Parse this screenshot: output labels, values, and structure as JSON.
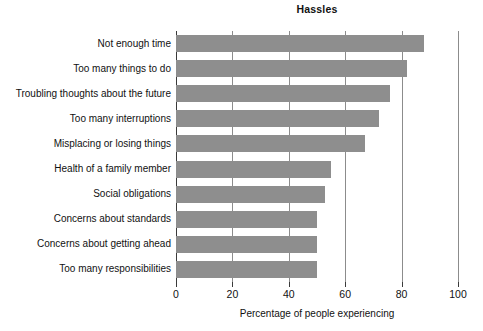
{
  "chart_data": {
    "type": "bar",
    "orientation": "horizontal",
    "title": "Hassles",
    "xlabel": "Percentage of people experiencing",
    "ylabel": "",
    "xlim": [
      0,
      100
    ],
    "xticks": [
      0,
      20,
      40,
      60,
      80,
      100
    ],
    "xticklabels": [
      "0",
      "20",
      "40",
      "60",
      "80",
      "100"
    ],
    "grid": "vertical",
    "legend": "none",
    "bar_color": "#8e8e8e",
    "axis_color": "#3a3a3a",
    "categories": [
      "Not enough time",
      "Too many things to do",
      "Troubling thoughts about the future",
      "Too many interruptions",
      "Misplacing or losing things",
      "Health of a family member",
      "Social obligations",
      "Concerns about standards",
      "Concerns about getting ahead",
      "Too many responsibilities"
    ],
    "values": [
      88,
      82,
      76,
      72,
      67,
      55,
      53,
      50,
      50,
      50
    ]
  }
}
